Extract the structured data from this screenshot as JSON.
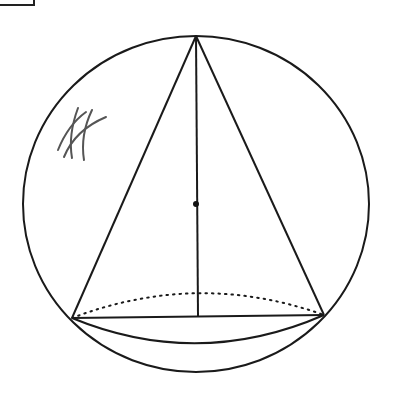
{
  "diagram": {
    "colors": {
      "stroke": "#1a1a1a",
      "hatch": "#555555",
      "background": "#ffffff"
    },
    "sphere": {
      "cx": 196,
      "cy": 204,
      "rx": 173,
      "ry": 168
    },
    "cone": {
      "apex": {
        "x": 196,
        "y": 36
      },
      "base_left": {
        "x": 72,
        "y": 318
      },
      "base_right": {
        "x": 324,
        "y": 315
      },
      "base_center": {
        "x": 198,
        "y": 316
      },
      "base_back_dotted": true
    },
    "center_point": {
      "x": 196,
      "y": 204
    },
    "hatch_mark": {
      "x": 70,
      "y": 110,
      "description": "handwritten crossed strokes"
    }
  }
}
